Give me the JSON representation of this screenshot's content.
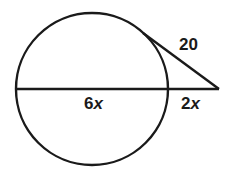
{
  "diagram": {
    "type": "circle-secant-tangent",
    "stroke_color": "#1a1a1a",
    "background": "#ffffff",
    "circle": {
      "cx": 92,
      "cy": 89,
      "r": 76
    },
    "secant": {
      "x1": 16,
      "y1": 89,
      "x2": 219,
      "y2": 89
    },
    "tangent": {
      "x1": 143,
      "y1": 33,
      "x2": 219,
      "y2": 89
    },
    "labels": {
      "tangent_length": {
        "num": "20",
        "var": ""
      },
      "internal_segment": {
        "num": "6",
        "var": "x"
      },
      "external_segment": {
        "num": "2",
        "var": "x"
      }
    }
  }
}
